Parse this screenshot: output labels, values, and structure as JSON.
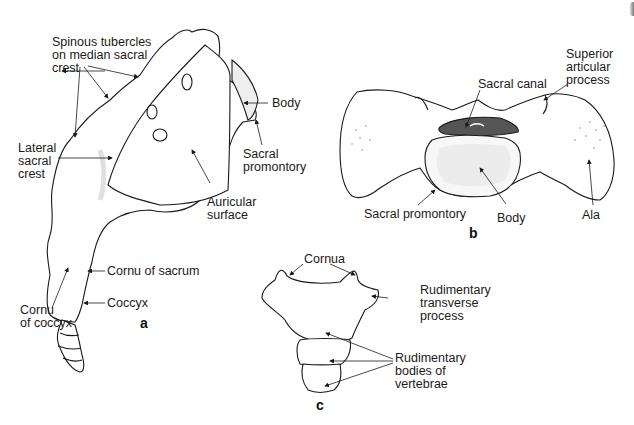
{
  "figure": {
    "panels": [
      {
        "id": "a",
        "view": "lateral view of sacrum and coccyx",
        "labels": [
          "Spinous tubercles\non median sacral\ncrest",
          "Body",
          "Lateral\nsacral\ncrest",
          "Sacral\npromontory",
          "Auricular\nsurface",
          "Cornu of sacrum",
          "Cornu\nof coccyx",
          "Coccyx"
        ]
      },
      {
        "id": "b",
        "view": "superior view of sacrum",
        "labels": [
          "Superior\narticular\nprocess",
          "Sacral canal",
          "Sacral promontory",
          "Body",
          "Ala"
        ]
      },
      {
        "id": "c",
        "view": "coccyx",
        "labels": [
          "Cornua",
          "Rudimentary\ntransverse\nprocess",
          "Rudimentary\nbodies of\nvertebrae"
        ]
      }
    ]
  },
  "colors": {
    "outline": "#1a1a1a",
    "shade": "#e3e3e3",
    "canal": "#555555"
  }
}
